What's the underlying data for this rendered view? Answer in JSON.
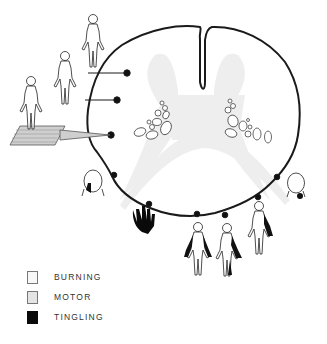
{
  "diagram": {
    "colors": {
      "outline": "#1a1a1a",
      "gray_matter": "#ececec",
      "burning": "#f7f7f7",
      "motor": "#e6e6e6",
      "tingling": "#0a0a0a",
      "hatched_platform": "#cfcfcf"
    },
    "figures": [
      {
        "name": "standing-figure-top",
        "symptom": "burning"
      },
      {
        "name": "seated-figure-middle",
        "symptom": "burning"
      },
      {
        "name": "standing-figure-on-platform",
        "symptom": "burning"
      },
      {
        "name": "face-left",
        "symptom": "tingling"
      },
      {
        "name": "hand",
        "symptom": "tingling"
      },
      {
        "name": "figure-bottom-1",
        "symptom": "tingling"
      },
      {
        "name": "figure-bottom-2",
        "symptom": "tingling"
      },
      {
        "name": "figure-bottom-3",
        "symptom": "tingling"
      },
      {
        "name": "face-right",
        "symptom": "tingling"
      }
    ]
  },
  "legend": {
    "items": [
      {
        "label": "BURNING",
        "color": "#f7f7f7"
      },
      {
        "label": "MOTOR",
        "color": "#e4e4e4"
      },
      {
        "label": "TINGLING",
        "color": "#0a0a0a"
      }
    ]
  }
}
